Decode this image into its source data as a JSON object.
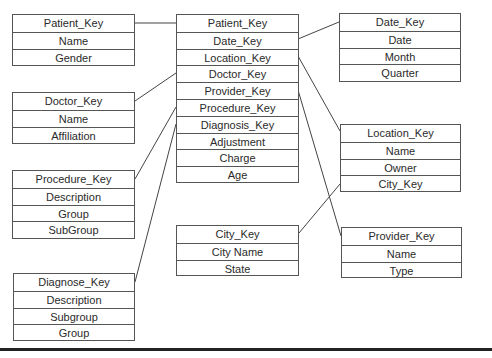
{
  "diagram": {
    "type": "star-schema",
    "fact_table": {
      "name": "fact",
      "fields": [
        "Patient_Key",
        "Date_Key",
        "Location_Key",
        "Doctor_Key",
        "Provider_Key",
        "Procedure_Key",
        "Diagnosis_Key",
        "Adjustment",
        "Charge",
        "Age"
      ]
    },
    "dimensions": {
      "patient": {
        "fields": [
          "Patient_Key",
          "Name",
          "Gender"
        ]
      },
      "doctor": {
        "fields": [
          "Doctor_Key",
          "Name",
          "Affiliation"
        ]
      },
      "procedure": {
        "fields": [
          "Procedure_Key",
          "Description",
          "Group",
          "SubGroup"
        ]
      },
      "diagnose": {
        "fields": [
          "Diagnose_Key",
          "Description",
          "Subgroup",
          "Group"
        ]
      },
      "date": {
        "fields": [
          "Date_Key",
          "Date",
          "Month",
          "Quarter"
        ]
      },
      "location": {
        "fields": [
          "Location_Key",
          "Name",
          "Owner",
          "City_Key"
        ]
      },
      "city": {
        "fields": [
          "City_Key",
          "City Name",
          "State"
        ]
      },
      "provider": {
        "fields": [
          "Provider_Key",
          "Name",
          "Type"
        ]
      }
    },
    "relationships": [
      {
        "from": "fact.Patient_Key",
        "to": "patient.Patient_Key"
      },
      {
        "from": "fact.Date_Key",
        "to": "date.Date_Key"
      },
      {
        "from": "fact.Location_Key",
        "to": "location.Location_Key"
      },
      {
        "from": "fact.Doctor_Key",
        "to": "doctor.Doctor_Key"
      },
      {
        "from": "fact.Provider_Key",
        "to": "provider.Provider_Key"
      },
      {
        "from": "fact.Procedure_Key",
        "to": "procedure.Procedure_Key"
      },
      {
        "from": "fact.Diagnosis_Key",
        "to": "diagnose.Diagnose_Key"
      },
      {
        "from": "location.City_Key",
        "to": "city.City_Key"
      }
    ]
  }
}
